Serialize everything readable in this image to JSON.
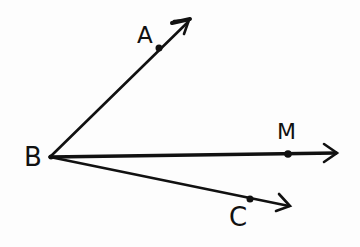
{
  "diagram": {
    "type": "geometry-rays",
    "style": "hand-drawn",
    "ink_color": "#111111",
    "background": "#fdfdfd",
    "vertex": {
      "label": "B",
      "x": 50,
      "y": 157
    },
    "rays": [
      {
        "name": "ray-BA",
        "point_label": "A",
        "point": {
          "x": 159,
          "y": 48
        },
        "tip": {
          "x": 190,
          "y": 20
        }
      },
      {
        "name": "ray-BM",
        "point_label": "M",
        "point": {
          "x": 288,
          "y": 154
        },
        "tip": {
          "x": 337,
          "y": 153
        }
      },
      {
        "name": "ray-BC",
        "point_label": "C",
        "point": {
          "x": 250,
          "y": 199
        },
        "tip": {
          "x": 290,
          "y": 206
        }
      }
    ]
  },
  "labels": {
    "A": "A",
    "B": "B",
    "M": "M",
    "C": "C"
  }
}
